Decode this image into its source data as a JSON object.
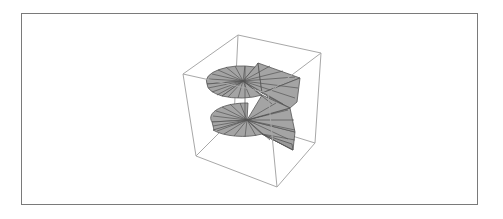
{
  "figure": {
    "type": "3d-surface-plot",
    "colors": {
      "background": "#ffffff",
      "frame_border": "#7a7a7a",
      "box_edges": "#a8a8a8",
      "surface_fill": "#a4a4a4",
      "mesh_lines": "#555555"
    },
    "turns": 2,
    "axes_visible": false,
    "ticks_visible": false
  }
}
